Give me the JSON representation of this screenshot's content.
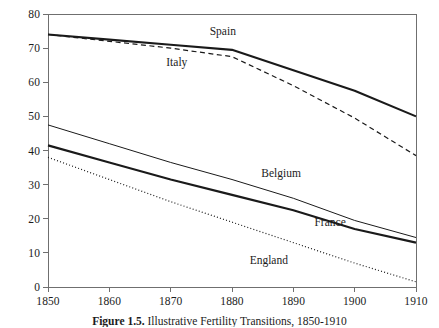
{
  "chart_data": {
    "type": "line",
    "title": "",
    "xlabel": "",
    "ylabel": "",
    "xlim": [
      1850,
      1910
    ],
    "ylim": [
      0,
      80
    ],
    "grid": false,
    "legend_position": "inline-labels",
    "x_ticks": [
      1850,
      1860,
      1870,
      1880,
      1890,
      1900,
      1910
    ],
    "y_ticks": [
      0,
      10,
      20,
      30,
      40,
      50,
      60,
      70,
      80
    ],
    "x": [
      1850,
      1860,
      1870,
      1880,
      1890,
      1900,
      1910
    ],
    "series": [
      {
        "name": "Spain",
        "style": "solid-thick",
        "values": [
          74.0,
          72.5,
          71.0,
          69.5,
          63.5,
          57.5,
          50.0
        ],
        "label_x": 1878.5,
        "label_y": 75.0
      },
      {
        "name": "Italy",
        "style": "dashed",
        "values": [
          74.0,
          72.0,
          70.0,
          67.5,
          59.0,
          49.5,
          38.5
        ],
        "label_x": 1871.0,
        "label_y": 66.0
      },
      {
        "name": "Belgium",
        "style": "solid-thin",
        "values": [
          47.5,
          42.0,
          36.5,
          31.5,
          26.0,
          19.5,
          14.5
        ],
        "label_x": 1888.0,
        "label_y": 33.5
      },
      {
        "name": "France",
        "style": "solid-thick",
        "values": [
          41.5,
          36.5,
          31.5,
          27.0,
          22.5,
          17.0,
          13.0
        ],
        "label_x": 1896.0,
        "label_y": 19.0
      },
      {
        "name": "England",
        "style": "dotted",
        "values": [
          38.0,
          31.5,
          25.0,
          19.0,
          13.0,
          7.0,
          1.5
        ],
        "label_x": 1886.0,
        "label_y": 8.0
      }
    ],
    "axis_tick_labels_y": [
      "80",
      "70",
      "60",
      "50",
      "40",
      "30",
      "20",
      "10",
      "0"
    ],
    "axis_tick_labels_x": [
      "1850",
      "1860",
      "1870",
      "1880",
      "1890",
      "1900",
      "1910"
    ]
  },
  "caption": {
    "number": "Figure 1.5.",
    "text": "Illustrative Fertility Transitions, 1850-1910"
  },
  "colors": {
    "line": "#1a1a1a",
    "axis": "#6f6f6f",
    "background": "#ffffff"
  }
}
